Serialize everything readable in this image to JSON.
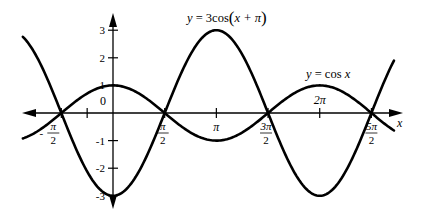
{
  "chart_data": {
    "type": "line",
    "title": "",
    "xlabel": "x",
    "ylabel": "",
    "xlim": [
      -2.74,
      8.54
    ],
    "ylim": [
      -3.3,
      3.5
    ],
    "grid": false,
    "legend": "inline labels",
    "x_ticks": [
      {
        "value": -1.5708,
        "label_num": "π",
        "label_den": "2",
        "sign": "-",
        "fraction": true
      },
      {
        "value": -0.7854,
        "label": "",
        "fraction": false
      },
      {
        "value": 1.5708,
        "label_num": "π",
        "label_den": "2",
        "sign": "",
        "fraction": true
      },
      {
        "value": 3.1416,
        "label": "π",
        "fraction": false
      },
      {
        "value": 4.7124,
        "label_num": "3π",
        "label_den": "2",
        "sign": "",
        "fraction": true
      },
      {
        "value": 6.2832,
        "label": "2π",
        "fraction": false
      },
      {
        "value": 7.854,
        "label_num": "5π",
        "label_den": "2",
        "sign": "",
        "fraction": true
      }
    ],
    "y_ticks": [
      {
        "value": 3,
        "label": "3"
      },
      {
        "value": 2,
        "label": "2"
      },
      {
        "value": 1,
        "label": "1"
      },
      {
        "value": 0,
        "label": "0"
      },
      {
        "value": -1,
        "label": "-1"
      },
      {
        "value": -2,
        "label": "-2"
      },
      {
        "value": -3,
        "label": "-3"
      }
    ],
    "series": [
      {
        "name": "y = cos x",
        "function": "cos(x)",
        "amplitude": 1,
        "phase": 0,
        "x": [
          -2.74,
          -1.5708,
          0,
          1.5708,
          3.1416,
          4.7124,
          6.2832,
          7.854,
          8.54
        ],
        "values": [
          -0.92,
          0,
          1,
          0,
          -1,
          0,
          1,
          0,
          -0.64
        ]
      },
      {
        "name": "y = 3cos(x + π)",
        "function": "3*cos(x+pi)",
        "amplitude": 3,
        "phase": 3.1416,
        "x": [
          -2.74,
          -1.5708,
          0,
          1.5708,
          3.1416,
          4.7124,
          6.2832,
          7.854,
          8.54
        ],
        "values": [
          2.76,
          0,
          -3,
          0,
          3,
          0,
          -3,
          0,
          1.93
        ]
      }
    ],
    "annotations": [
      {
        "text": "y = 3cos(x + π)",
        "series": 1
      },
      {
        "text": "y = cos x",
        "series": 0
      }
    ]
  },
  "labels": {
    "curve_big_prefix": "y",
    "curve_big_eq": " = 3cos",
    "curve_big_arg_x": "x",
    "curve_big_arg_rest": " + π",
    "curve_small_prefix": "y",
    "curve_small_eq": " = cos ",
    "curve_small_x": "x",
    "x_axis_label": "x",
    "origin_label": "0"
  }
}
